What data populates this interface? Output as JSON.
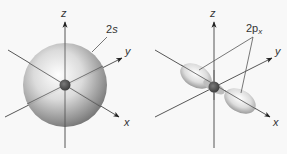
{
  "figure": {
    "panels": [
      {
        "id": "2s",
        "orbital_label": "2s",
        "orbital_label_main": "2",
        "orbital_label_sub": "s",
        "shape": "sphere",
        "axes": {
          "z": "z",
          "y": "y",
          "x": "x"
        }
      },
      {
        "id": "2px",
        "orbital_label": "2px",
        "orbital_label_main": "2p",
        "orbital_label_sub": "x",
        "shape": "dumbbell along x-axis",
        "axes": {
          "z": "z",
          "y": "y",
          "x": "x"
        }
      }
    ],
    "colors": {
      "background": "#f8f8f8",
      "axis": "#333333",
      "orbital_light": "#f4f4f4",
      "orbital_dark": "#6e6e6e",
      "nucleus": "#4a4a4a"
    }
  }
}
